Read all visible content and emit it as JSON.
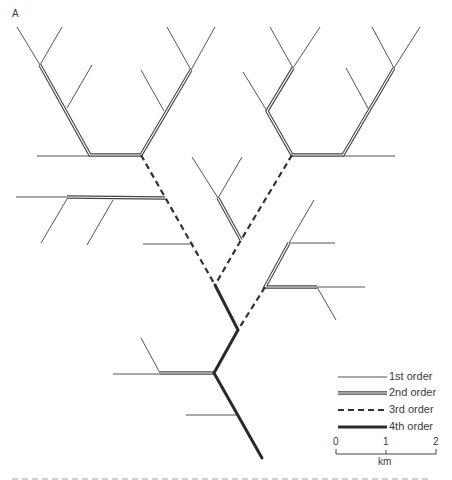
{
  "figure": {
    "panel_label": "A"
  },
  "legend": {
    "items": [
      {
        "label": "1st order",
        "style": "thin"
      },
      {
        "label": "2nd order",
        "style": "double"
      },
      {
        "label": "3rd order",
        "style": "dashed"
      },
      {
        "label": "4th order",
        "style": "thick"
      }
    ]
  },
  "scale_bar": {
    "ticks": [
      "0",
      "1",
      "2"
    ],
    "unit": "km"
  },
  "colors": {
    "line": "#3a3a3a",
    "background": "#ffffff"
  }
}
